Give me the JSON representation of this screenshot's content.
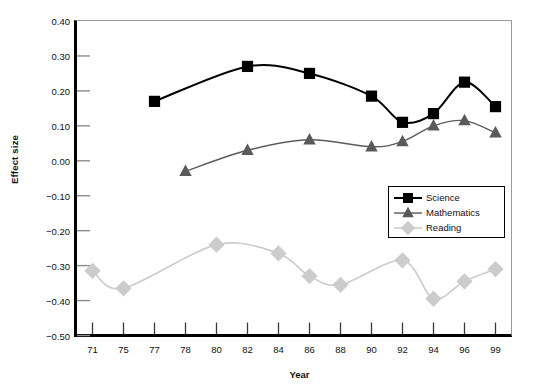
{
  "chart_data": {
    "type": "line",
    "title": "",
    "xlabel": "Year",
    "ylabel": "Effect size",
    "categories": [
      "71",
      "75",
      "77",
      "78",
      "80",
      "82",
      "84",
      "86",
      "88",
      "90",
      "92",
      "94",
      "96",
      "99"
    ],
    "ylim": [
      -0.5,
      0.4
    ],
    "yticks": [
      "0.40",
      "0.30",
      "0.20",
      "0.10",
      "0.00",
      "−0.10",
      "−0.20",
      "−0.30",
      "−0.40",
      "−0.50"
    ],
    "ytick_values": [
      0.4,
      0.3,
      0.2,
      0.1,
      0.0,
      -0.1,
      -0.2,
      -0.3,
      -0.4,
      -0.5
    ],
    "grid": false,
    "legend_position": "center-right",
    "series": [
      {
        "name": "Science",
        "color": "#000000",
        "marker": "square",
        "x": [
          "77",
          "82",
          "86",
          "90",
          "92",
          "94",
          "96",
          "99"
        ],
        "values": [
          0.17,
          0.27,
          0.25,
          0.185,
          0.11,
          0.135,
          0.225,
          0.155
        ]
      },
      {
        "name": "Mathematics",
        "color": "#5a5a5a",
        "marker": "triangle",
        "x": [
          "78",
          "82",
          "86",
          "90",
          "92",
          "94",
          "96",
          "99"
        ],
        "values": [
          -0.03,
          0.03,
          0.06,
          0.04,
          0.055,
          0.1,
          0.115,
          0.08
        ]
      },
      {
        "name": "Reading",
        "color": "#cccccc",
        "marker": "diamond",
        "x": [
          "71",
          "75",
          "80",
          "84",
          "86",
          "88",
          "92",
          "94",
          "96",
          "99"
        ],
        "values": [
          -0.315,
          -0.365,
          -0.24,
          -0.265,
          -0.33,
          -0.355,
          -0.285,
          -0.395,
          -0.345,
          -0.31
        ]
      }
    ]
  },
  "legend": {
    "items": [
      {
        "label": "Science"
      },
      {
        "label": "Mathematics"
      },
      {
        "label": "Reading"
      }
    ]
  }
}
